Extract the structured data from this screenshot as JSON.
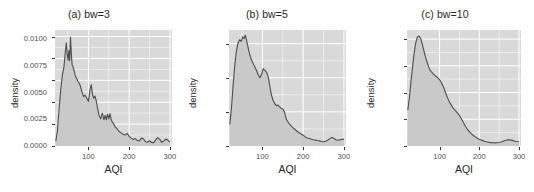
{
  "figure": {
    "background": "#ffffff",
    "panel_background": "#d9d9d9",
    "gridline_color": "#ffffff",
    "curve_color": "#4d4d4d",
    "fill_color": "#c9c9c9",
    "tick_color": "#333333"
  },
  "chart_data": [
    {
      "type": "area",
      "title": "(a) bw=3",
      "xlabel": "AQI",
      "ylabel": "density",
      "xlim": [
        18,
        305
      ],
      "ylim": [
        0.0,
        0.01325
      ],
      "xticks": [
        100,
        200,
        300
      ],
      "xticklabels": [
        "100",
        "200",
        "300"
      ],
      "yticks": [
        0.0,
        0.0025,
        0.005,
        0.0075,
        0.01,
        0.0125
      ],
      "yticklabels": [
        "0.0000",
        "0.0025",
        "0.0050",
        "0.0075",
        "0.0100",
        "0.0125"
      ],
      "grid": true,
      "legend": "none",
      "x": [
        20,
        24,
        28,
        32,
        36,
        40,
        43,
        46,
        48,
        50,
        52,
        54,
        56,
        58,
        60,
        62,
        65,
        68,
        71,
        74,
        77,
        80,
        84,
        88,
        92,
        96,
        100,
        104,
        107,
        110,
        113,
        116,
        119,
        122,
        126,
        130,
        134,
        138,
        141,
        144,
        147,
        150,
        153,
        156,
        159,
        162,
        166,
        170,
        175,
        180,
        185,
        190,
        195,
        200,
        205,
        210,
        215,
        220,
        225,
        230,
        235,
        240,
        245,
        250,
        255,
        260,
        265,
        270,
        275,
        280,
        285,
        290,
        295,
        300
      ],
      "y": [
        0.00055,
        0.00175,
        0.0042,
        0.0064,
        0.0081,
        0.00905,
        0.0106,
        0.0118,
        0.01055,
        0.0098,
        0.0109,
        0.00975,
        0.01245,
        0.0106,
        0.00925,
        0.0091,
        0.00855,
        0.008,
        0.0077,
        0.0074,
        0.0072,
        0.0069,
        0.0062,
        0.00565,
        0.0058,
        0.00545,
        0.0051,
        0.0065,
        0.007,
        0.0059,
        0.00545,
        0.0057,
        0.0052,
        0.0044,
        0.0035,
        0.0031,
        0.00375,
        0.003,
        0.0035,
        0.003,
        0.00365,
        0.0031,
        0.0037,
        0.003,
        0.0027,
        0.00255,
        0.00215,
        0.002,
        0.00165,
        0.0015,
        0.00135,
        0.00125,
        0.00145,
        0.0011,
        0.0009,
        0.00075,
        0.00085,
        0.00062,
        0.00058,
        0.0009,
        0.00082,
        0.00048,
        0.00043,
        0.0006,
        0.0004,
        0.00038,
        0.0007,
        0.00095,
        0.00075,
        0.00042,
        0.00058,
        0.0008,
        0.00065,
        0.00045
      ]
    },
    {
      "type": "area",
      "title": "(b) bw=5",
      "xlabel": "AQI",
      "ylabel": "density",
      "xlim": [
        18,
        305
      ],
      "ylim": [
        0.0,
        0.0102
      ],
      "xticks": [
        100,
        200,
        300
      ],
      "xticklabels": [
        "100",
        "200",
        "300"
      ],
      "yticks": [
        0.0,
        0.003,
        0.006,
        0.009
      ],
      "yticklabels": [
        "0.000",
        "0.003",
        "0.006",
        "0.009"
      ],
      "grid": true,
      "legend": "none",
      "x": [
        20,
        24,
        28,
        32,
        36,
        40,
        44,
        48,
        52,
        55,
        58,
        61,
        64,
        67,
        70,
        74,
        78,
        82,
        86,
        90,
        94,
        98,
        102,
        106,
        110,
        114,
        118,
        122,
        126,
        130,
        134,
        138,
        142,
        146,
        150,
        154,
        158,
        162,
        166,
        170,
        175,
        180,
        185,
        190,
        195,
        200,
        205,
        210,
        215,
        220,
        225,
        230,
        235,
        240,
        245,
        250,
        255,
        260,
        265,
        270,
        275,
        280,
        285,
        290,
        295,
        300
      ],
      "y": [
        0.0019,
        0.0033,
        0.0053,
        0.007,
        0.0083,
        0.00905,
        0.00935,
        0.0092,
        0.0096,
        0.00945,
        0.00975,
        0.0093,
        0.0088,
        0.0083,
        0.0079,
        0.0075,
        0.0072,
        0.0069,
        0.0066,
        0.00625,
        0.006,
        0.0063,
        0.0068,
        0.00665,
        0.0065,
        0.0061,
        0.0053,
        0.0045,
        0.004,
        0.00375,
        0.00355,
        0.0036,
        0.00345,
        0.0033,
        0.00325,
        0.003,
        0.0024,
        0.00215,
        0.00195,
        0.0018,
        0.0016,
        0.00145,
        0.0013,
        0.00115,
        0.00105,
        0.00095,
        0.0008,
        0.0007,
        0.00068,
        0.0006,
        0.00055,
        0.00052,
        0.00048,
        0.00045,
        0.0004,
        0.00038,
        0.00042,
        0.0005,
        0.00065,
        0.00075,
        0.00068,
        0.00055,
        0.0005,
        0.00055,
        0.0006,
        0.00058
      ]
    },
    {
      "type": "area",
      "title": "(c) bw=10",
      "xlabel": "AQI",
      "ylabel": "density",
      "xlim": [
        18,
        305
      ],
      "ylim": [
        0.0,
        0.01085
      ],
      "xticks": [
        100,
        200,
        300
      ],
      "xticklabels": [
        "100",
        "200",
        "300"
      ],
      "yticks": [
        0.0,
        0.0025,
        0.005,
        0.0075,
        0.01
      ],
      "yticklabels": [
        "0.0000",
        "0.0025",
        "0.0050",
        "0.0075",
        "0.0100"
      ],
      "grid": true,
      "legend": "none",
      "x": [
        20,
        24,
        28,
        32,
        36,
        40,
        44,
        48,
        52,
        56,
        60,
        64,
        68,
        72,
        76,
        80,
        85,
        90,
        95,
        100,
        105,
        110,
        115,
        120,
        125,
        130,
        135,
        140,
        145,
        150,
        155,
        160,
        165,
        170,
        175,
        180,
        185,
        190,
        195,
        200,
        205,
        210,
        215,
        220,
        225,
        230,
        235,
        240,
        245,
        250,
        255,
        260,
        265,
        270,
        275,
        280,
        285,
        290,
        295,
        300
      ],
      "y": [
        0.00335,
        0.0045,
        0.006,
        0.0074,
        0.0087,
        0.00965,
        0.0102,
        0.0103,
        0.0101,
        0.0096,
        0.009,
        0.0084,
        0.0079,
        0.00745,
        0.0071,
        0.0069,
        0.0067,
        0.00655,
        0.0064,
        0.0062,
        0.0059,
        0.0055,
        0.005,
        0.0045,
        0.0041,
        0.0038,
        0.0035,
        0.0033,
        0.0031,
        0.00285,
        0.00255,
        0.0022,
        0.00185,
        0.00155,
        0.00135,
        0.00115,
        0.00098,
        0.00085,
        0.00073,
        0.00063,
        0.00055,
        0.00048,
        0.00042,
        0.00038,
        0.00034,
        0.00032,
        0.0003,
        0.00029,
        0.0003,
        0.00033,
        0.00038,
        0.00045,
        0.00052,
        0.00057,
        0.00058,
        0.00055,
        0.0005,
        0.00045,
        0.00042,
        0.0004
      ]
    }
  ]
}
